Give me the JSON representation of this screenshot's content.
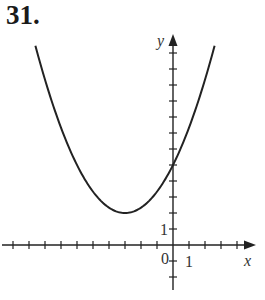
{
  "problem": {
    "number": "31."
  },
  "chart_data": {
    "type": "line",
    "title": "",
    "xlabel": "x",
    "ylabel": "y",
    "function": "y = (1/3)(x + 3)^2 + 2",
    "vertex": [
      -3,
      2
    ],
    "y_intercept": 5,
    "x_range": [
      -10,
      5
    ],
    "y_range": [
      -2.5,
      13
    ],
    "tick_labels": {
      "origin": "0",
      "x_one": "1",
      "y_one": "1"
    },
    "x_ticks": [
      -10,
      -9,
      -8,
      -7,
      -6,
      -5,
      -4,
      -3,
      -2,
      -1,
      1,
      2,
      3,
      4
    ],
    "y_ticks": [
      -2,
      -1,
      1,
      2,
      3,
      4,
      5,
      6,
      7,
      8,
      9,
      10,
      11,
      12
    ],
    "points": [
      {
        "x": -8.6,
        "y": 12.45
      },
      {
        "x": -6,
        "y": 5
      },
      {
        "x": -3,
        "y": 2
      },
      {
        "x": 0,
        "y": 5
      },
      {
        "x": 2.6,
        "y": 12.45
      }
    ],
    "grid": false,
    "legend": null
  },
  "colors": {
    "ink": "#222222",
    "background": "#ffffff"
  }
}
